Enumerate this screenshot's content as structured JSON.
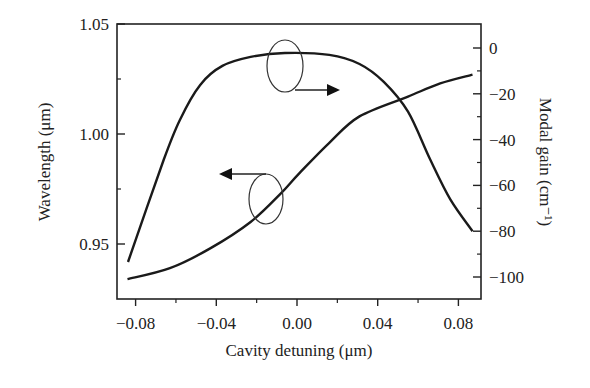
{
  "chart_data": {
    "type": "line",
    "title": "",
    "xlabel": "Cavity detuning (μm)",
    "ylabel": "Wavelength (μm)",
    "y2label": "Modal gain (cm⁻¹)",
    "xlim": [
      -0.09,
      0.09
    ],
    "ylim": [
      0.925,
      1.05
    ],
    "y2lim": [
      -110,
      10
    ],
    "x_ticks": [
      -0.08,
      -0.04,
      0.0,
      0.04,
      0.08
    ],
    "x_tick_labels": [
      "−0.08",
      "−0.04",
      "0.00",
      "0.04",
      "0.08"
    ],
    "y_ticks": [
      0.95,
      1.0,
      1.05
    ],
    "y_tick_labels": [
      "0.95",
      "1.00",
      "1.05"
    ],
    "y2_ticks": [
      0,
      -20,
      -40,
      -60,
      -80,
      -100
    ],
    "y2_tick_labels": [
      "0",
      "−20",
      "−40",
      "−60",
      "−80",
      "−100"
    ],
    "grid": false,
    "legend": null,
    "series": [
      {
        "name": "Wavelength",
        "axis": "left",
        "x": [
          -0.084,
          -0.063,
          -0.043,
          -0.023,
          -0.008,
          0.001,
          0.016,
          0.031,
          0.055,
          0.071,
          0.087
        ],
        "values": [
          0.934,
          0.939,
          0.948,
          0.96,
          0.973,
          0.982,
          0.996,
          1.008,
          1.017,
          1.023,
          1.027
        ]
      },
      {
        "name": "Modal gain",
        "axis": "right",
        "x": [
          -0.066,
          -0.058,
          -0.048,
          -0.037,
          -0.023,
          -0.006,
          0.016,
          0.031,
          0.043,
          0.055,
          0.066,
          0.076,
          0.087
        ],
        "values": [
          -48.7,
          -31.3,
          -16.1,
          -7.8,
          -3.9,
          -2.2,
          -3.0,
          -7.0,
          -14.8,
          -27.8,
          -48.7,
          -66.1,
          -80.0
        ]
      }
    ],
    "annotations": [
      {
        "type": "ellipse-arrow",
        "target": "Modal gain",
        "points_to": "right axis"
      },
      {
        "type": "ellipse-arrow",
        "target": "Wavelength",
        "points_to": "left axis"
      }
    ]
  }
}
